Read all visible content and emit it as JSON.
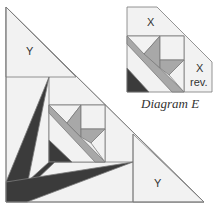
{
  "diagram": {
    "main": {
      "labels": {
        "y_top": "Y",
        "y_bottom": "Y"
      }
    },
    "inset": {
      "labels": {
        "x_top": "X",
        "x_rev_1": "X",
        "x_rev_2": "rev."
      },
      "caption": "Diagram E"
    },
    "colors": {
      "light": "#f2f2f2",
      "mid": "#a8a8a8",
      "dark": "#3b3b3b",
      "line": "#7a7a7a",
      "white": "#ffffff"
    }
  }
}
